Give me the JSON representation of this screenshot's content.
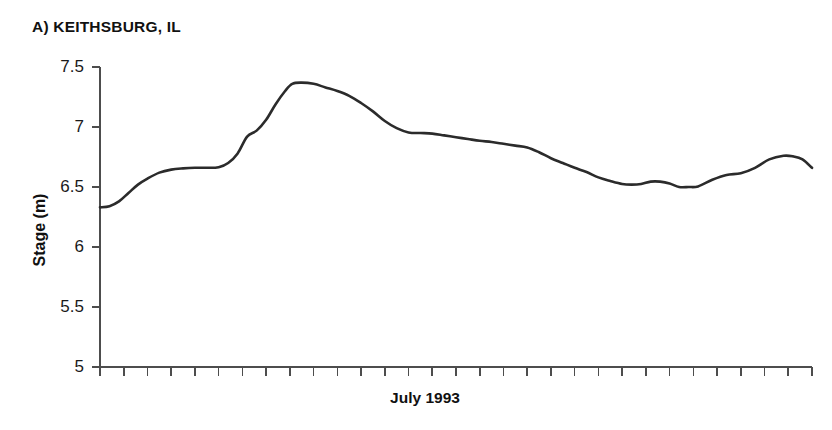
{
  "panel": {
    "title": "A) KEITHSBURG, IL"
  },
  "chart_data": {
    "type": "line",
    "title": "A) KEITHSBURG, IL",
    "xlabel": "July 1993",
    "ylabel": "Stage (m)",
    "ylim": [
      5,
      7.5
    ],
    "xlim": [
      1,
      31
    ],
    "yticks": [
      5,
      5.5,
      6,
      6.5,
      7,
      7.5
    ],
    "ytick_labels": [
      "5",
      "5.5",
      "6",
      "6.5",
      "7",
      "7.5"
    ],
    "xticks": [
      1,
      2,
      3,
      4,
      5,
      6,
      7,
      8,
      9,
      10,
      11,
      12,
      13,
      14,
      15,
      16,
      17,
      18,
      19,
      20,
      21,
      22,
      23,
      24,
      25,
      26,
      27,
      28,
      29,
      30,
      31
    ],
    "xtick_labels": [],
    "grid": false,
    "legend": false,
    "line_color": "#2b2b2b",
    "axis_color": "#4d4d4d",
    "series": [
      {
        "name": "Stage",
        "x": [
          1,
          1.4,
          1.8,
          2.2,
          2.6,
          3,
          3.5,
          4,
          4.5,
          5,
          5.5,
          6,
          6.4,
          6.8,
          7.2,
          7.6,
          8,
          8.4,
          8.8,
          9.1,
          9.5,
          10,
          10.5,
          11,
          11.5,
          12,
          12.5,
          13,
          13.5,
          14,
          14.5,
          15,
          15.5,
          16,
          16.5,
          17,
          17.5,
          18,
          18.5,
          19,
          19.5,
          20,
          20.5,
          21,
          21.5,
          22,
          22.5,
          23,
          23.4,
          23.8,
          24.2,
          24.6,
          25,
          25.4,
          25.8,
          26.2,
          26.8,
          27.4,
          28,
          28.6,
          29.2,
          29.8,
          30.2,
          30.6,
          31
        ],
        "values": [
          6.33,
          6.34,
          6.38,
          6.45,
          6.52,
          6.57,
          6.62,
          6.645,
          6.655,
          6.66,
          6.66,
          6.665,
          6.7,
          6.78,
          6.92,
          6.97,
          7.06,
          7.19,
          7.3,
          7.36,
          7.37,
          7.36,
          7.33,
          7.3,
          7.26,
          7.2,
          7.13,
          7.05,
          6.99,
          6.955,
          6.95,
          6.945,
          6.93,
          6.915,
          6.9,
          6.885,
          6.875,
          6.86,
          6.845,
          6.83,
          6.79,
          6.74,
          6.7,
          6.66,
          6.625,
          6.58,
          6.55,
          6.525,
          6.52,
          6.525,
          6.545,
          6.545,
          6.53,
          6.5,
          6.5,
          6.505,
          6.56,
          6.6,
          6.615,
          6.66,
          6.73,
          6.76,
          6.755,
          6.73,
          6.66
        ]
      }
    ],
    "annotations": [
      {
        "label": "initial stage",
        "x": 1,
        "y": 6.33
      },
      {
        "label": "first plateau",
        "x": 5.3,
        "y": 6.66
      },
      {
        "label": "flood crest",
        "x": 9.5,
        "y": 7.37
      },
      {
        "label": "secondary shoulder",
        "x": 14.3,
        "y": 6.95
      },
      {
        "label": "low dip",
        "x": 25.8,
        "y": 6.5
      },
      {
        "label": "secondary crest",
        "x": 29.8,
        "y": 6.76
      },
      {
        "label": "final recession",
        "x": 31,
        "y": 5.32
      }
    ]
  },
  "axes": {
    "y_label": "Stage (m)",
    "x_label": "July 1993"
  }
}
